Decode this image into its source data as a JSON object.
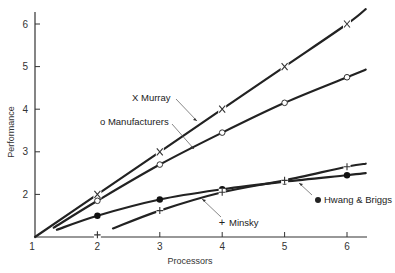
{
  "chart_data": {
    "type": "line",
    "title": "",
    "xlabel": "Processors",
    "ylabel": "Performance",
    "xlim": [
      1,
      6.3
    ],
    "ylim": [
      1,
      6.3
    ],
    "x_ticks": [
      "1",
      "2",
      "3",
      "4",
      "5",
      "6"
    ],
    "y_ticks": [
      "2",
      "3",
      "4",
      "5",
      "6"
    ],
    "origin_label": "1",
    "grid": false,
    "legend_position": "inline annotations with arrows",
    "series": [
      {
        "name": "Murray",
        "marker": "x",
        "marker_symbol": "X",
        "x": [
          2,
          3,
          4,
          5,
          6
        ],
        "values": [
          2.0,
          3.0,
          4.0,
          5.0,
          6.0
        ]
      },
      {
        "name": "Manufacturers",
        "marker": "o",
        "marker_symbol": "o",
        "x": [
          2,
          3,
          4,
          5,
          6
        ],
        "values": [
          1.85,
          2.7,
          3.45,
          4.15,
          4.75
        ]
      },
      {
        "name": "Hwang & Briggs",
        "marker": "filled-circle",
        "marker_symbol": "●",
        "x": [
          2,
          3,
          4,
          5,
          6
        ],
        "values": [
          1.5,
          1.88,
          2.12,
          2.3,
          2.45
        ]
      },
      {
        "name": "Minsky",
        "marker": "+",
        "marker_symbol": "+",
        "x": [
          2,
          3,
          4,
          5,
          6
        ],
        "values": [
          1.05,
          1.62,
          2.05,
          2.33,
          2.65
        ]
      }
    ]
  },
  "labels": {
    "murray": "X Murray",
    "manufacturers": "o Manufacturers",
    "hwang_briggs": "Hwang & Briggs",
    "minsky": "Minsky"
  }
}
